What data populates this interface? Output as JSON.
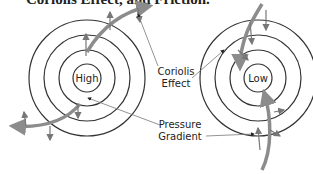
{
  "title": "Coriolis Effect, and Friction.",
  "diagrams": [
    {
      "center_label": "High",
      "cx": 87,
      "cy": 78
    },
    {
      "center_label": "Low",
      "cx": 258,
      "cy": 78
    }
  ],
  "labels": {
    "coriolis_line1": "Coriolis",
    "coriolis_line2": "Effect",
    "pressure_line1": "Pressure",
    "pressure_line2": "Gradient"
  },
  "colors": {
    "circle": "#333333",
    "flow_arrow": "#8c8c8c",
    "vector": "#777777",
    "text": "#222222"
  }
}
